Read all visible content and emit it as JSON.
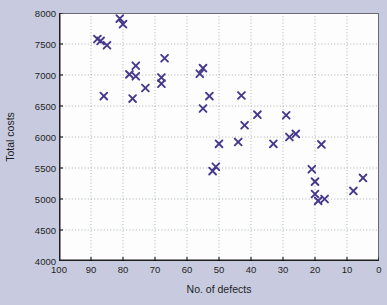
{
  "colors": {
    "background": "#c8cbdf",
    "plot_background": "#fdfdfd",
    "frame": "#6a6a74",
    "axis": "#1e1e1e",
    "grid": "#a8b2b2",
    "marker": "#46398b",
    "text": "#1e1e24"
  },
  "chart_data": {
    "type": "scatter",
    "title": "",
    "xlabel": "No. of defects",
    "ylabel": "Total costs",
    "xlim": [
      100,
      0
    ],
    "ylim": [
      4000,
      8000
    ],
    "x_ticks": [
      100,
      90,
      80,
      70,
      60,
      50,
      40,
      30,
      20,
      10,
      0
    ],
    "y_ticks": [
      4000,
      4500,
      5000,
      5500,
      6000,
      6500,
      7000,
      7500,
      8000
    ],
    "grid": true,
    "legend": "none",
    "marker": "x",
    "marker_color": "#46398b",
    "points": [
      [
        81,
        7910
      ],
      [
        80,
        7820
      ],
      [
        88,
        7580
      ],
      [
        87,
        7550
      ],
      [
        85,
        7480
      ],
      [
        67,
        7270
      ],
      [
        76,
        7150
      ],
      [
        78,
        7010
      ],
      [
        76,
        6980
      ],
      [
        68,
        6960
      ],
      [
        68,
        6860
      ],
      [
        73,
        6790
      ],
      [
        86,
        6660
      ],
      [
        77,
        6620
      ],
      [
        55,
        7110
      ],
      [
        56,
        7020
      ],
      [
        53,
        6660
      ],
      [
        55,
        6460
      ],
      [
        43,
        6670
      ],
      [
        38,
        6360
      ],
      [
        42,
        6190
      ],
      [
        50,
        5890
      ],
      [
        44,
        5920
      ],
      [
        51,
        5520
      ],
      [
        52,
        5450
      ],
      [
        29,
        6350
      ],
      [
        33,
        5890
      ],
      [
        28,
        6000
      ],
      [
        26,
        6050
      ],
      [
        18,
        5880
      ],
      [
        21,
        5480
      ],
      [
        20,
        5280
      ],
      [
        20,
        5080
      ],
      [
        19,
        4970
      ],
      [
        17,
        5000
      ],
      [
        8,
        5130
      ],
      [
        5,
        5340
      ]
    ]
  }
}
